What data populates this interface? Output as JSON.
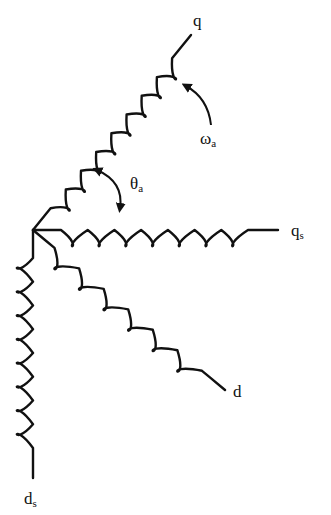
{
  "diagram": {
    "type": "coil-axes-schematic",
    "origin": [
      33,
      230
    ],
    "stroke_color": "#111111",
    "background": "#ffffff",
    "coils": [
      {
        "id": "q",
        "label": "q",
        "subscript": "",
        "end": [
          191,
          35
        ],
        "loops": 8,
        "label_pos": [
          193,
          12
        ]
      },
      {
        "id": "qs",
        "label": "q",
        "subscript": "s",
        "end": [
          278,
          230
        ],
        "loops": 7,
        "label_pos": [
          291,
          222
        ]
      },
      {
        "id": "d",
        "label": "d",
        "subscript": "",
        "end": [
          225,
          390
        ],
        "loops": 6,
        "label_pos": [
          233,
          383
        ]
      },
      {
        "id": "ds",
        "label": "d",
        "subscript": "s",
        "end": [
          33,
          478
        ],
        "loops": 8,
        "label_pos": [
          24,
          490
        ]
      }
    ],
    "annotations": [
      {
        "id": "omega",
        "symbol": "ω",
        "subscript": "a",
        "label_pos": [
          200,
          130
        ],
        "meaning": "rotation arrow"
      },
      {
        "id": "theta",
        "symbol": "θ",
        "subscript": "a",
        "label_pos": [
          130,
          175
        ],
        "meaning": "angle between q and qs"
      }
    ]
  }
}
